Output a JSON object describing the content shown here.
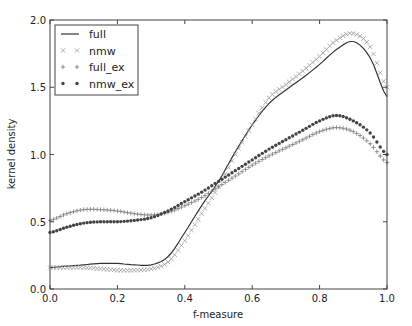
{
  "chart_data": {
    "type": "line",
    "title": "",
    "xlabel": "f-measure",
    "ylabel": "kernel density",
    "xlim": [
      0.0,
      1.0
    ],
    "ylim": [
      0.0,
      2.0
    ],
    "xticks": [
      "0.0",
      "0.2",
      "0.4",
      "0.6",
      "0.8",
      "1.0"
    ],
    "yticks": [
      "0.0",
      "0.5",
      "1.0",
      "1.5",
      "2.0"
    ],
    "grid": false,
    "legend_position": "upper left",
    "x": [
      0.0,
      0.05,
      0.1,
      0.15,
      0.2,
      0.25,
      0.3,
      0.35,
      0.4,
      0.45,
      0.5,
      0.55,
      0.6,
      0.65,
      0.7,
      0.75,
      0.8,
      0.85,
      0.9,
      0.95,
      1.0
    ],
    "series": [
      {
        "name": "full",
        "style": "solid-line",
        "color": "#333333",
        "values": [
          0.16,
          0.17,
          0.18,
          0.19,
          0.19,
          0.18,
          0.18,
          0.24,
          0.42,
          0.62,
          0.8,
          1.02,
          1.22,
          1.38,
          1.48,
          1.57,
          1.67,
          1.78,
          1.84,
          1.72,
          1.43
        ]
      },
      {
        "name": "nmw",
        "style": "x-marker",
        "color": "#999999",
        "values": [
          0.16,
          0.16,
          0.16,
          0.15,
          0.14,
          0.14,
          0.15,
          0.2,
          0.36,
          0.56,
          0.76,
          1.0,
          1.22,
          1.42,
          1.52,
          1.62,
          1.73,
          1.85,
          1.9,
          1.8,
          1.5
        ]
      },
      {
        "name": "full_ex",
        "style": "plus-marker",
        "color": "#777777",
        "values": [
          0.51,
          0.56,
          0.59,
          0.59,
          0.58,
          0.56,
          0.55,
          0.57,
          0.62,
          0.68,
          0.76,
          0.84,
          0.92,
          0.99,
          1.05,
          1.11,
          1.17,
          1.2,
          1.17,
          1.08,
          0.94
        ]
      },
      {
        "name": "nmw_ex",
        "style": "star-marker",
        "color": "#444444",
        "values": [
          0.42,
          0.46,
          0.49,
          0.5,
          0.5,
          0.51,
          0.53,
          0.58,
          0.65,
          0.72,
          0.8,
          0.88,
          0.96,
          1.04,
          1.11,
          1.18,
          1.25,
          1.29,
          1.25,
          1.16,
          1.0
        ]
      }
    ]
  }
}
